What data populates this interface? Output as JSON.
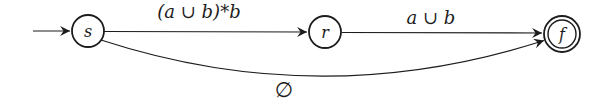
{
  "diagram": {
    "kind": "finite-automaton",
    "colors": {
      "background": "#ffffff",
      "stroke": "#1c1c1c",
      "text": "#1c1c1c"
    },
    "automaton": {
      "states": [
        {
          "id": "s",
          "label": "s",
          "initial": true,
          "accepting": false
        },
        {
          "id": "r",
          "label": "r",
          "initial": false,
          "accepting": false
        },
        {
          "id": "f",
          "label": "f",
          "initial": false,
          "accepting": true
        }
      ],
      "transitions": [
        {
          "from": "s",
          "to": "r",
          "label": "(a ∪ b)*b"
        },
        {
          "from": "r",
          "to": "f",
          "label": "a ∪ b"
        },
        {
          "from": "s",
          "to": "f",
          "label": "∅"
        }
      ]
    }
  }
}
